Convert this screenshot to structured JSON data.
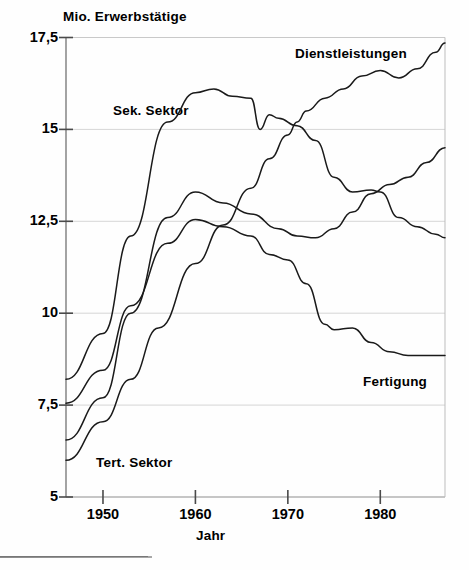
{
  "chart_data": {
    "type": "line",
    "title": "",
    "ylabel": "Mio. Erwerbstätige",
    "xlabel": "Jahr",
    "ylim": [
      5,
      17.5
    ],
    "xlim": [
      1946,
      1987
    ],
    "yticks": [
      "5",
      "7,5",
      "10",
      "12,5",
      "15",
      "17,5"
    ],
    "ytick_values": [
      5,
      7.5,
      10,
      12.5,
      15,
      17.5
    ],
    "xticks": [
      "1950",
      "1960",
      "1970",
      "1980"
    ],
    "xtick_values": [
      1950,
      1960,
      1970,
      1980
    ],
    "grid": true,
    "legend_position": "inline-annotations",
    "line_color": "#1a1a1a",
    "series": [
      {
        "name": "Dienstleistungen",
        "label_text": "Dienstleistungen",
        "x": [
          1946,
          1950,
          1953,
          1956,
          1960,
          1963,
          1966,
          1968,
          1970,
          1971,
          1972,
          1974,
          1976,
          1978,
          1980,
          1982,
          1984,
          1986,
          1987
        ],
        "values": [
          6.0,
          7.05,
          8.2,
          9.6,
          11.35,
          12.4,
          13.4,
          14.2,
          14.85,
          15.2,
          15.5,
          15.85,
          16.1,
          16.45,
          16.6,
          16.4,
          16.65,
          17.1,
          17.35
        ]
      },
      {
        "name": "Sek. Sektor",
        "label_text": "Sek. Sektor",
        "x": [
          1946,
          1950,
          1953,
          1957,
          1960,
          1962,
          1964,
          1966,
          1967,
          1968,
          1969,
          1971,
          1973,
          1975,
          1977,
          1979,
          1980,
          1982,
          1984,
          1986,
          1987
        ],
        "values": [
          8.2,
          9.45,
          12.1,
          15.2,
          16.0,
          16.1,
          15.9,
          15.85,
          15.0,
          15.4,
          15.3,
          15.1,
          14.7,
          13.7,
          13.3,
          13.35,
          13.3,
          12.6,
          12.35,
          12.15,
          12.05
        ]
      },
      {
        "name": "Tert. Sektor",
        "label_text": "Tert. Sektor",
        "x": [
          1946,
          1950,
          1953,
          1957,
          1960,
          1963,
          1966,
          1969,
          1971,
          1973,
          1975,
          1977,
          1979,
          1981,
          1983,
          1985,
          1987
        ],
        "values": [
          6.55,
          7.7,
          10.0,
          12.6,
          13.3,
          13.0,
          12.7,
          12.3,
          12.1,
          12.05,
          12.3,
          12.75,
          13.25,
          13.5,
          13.7,
          14.1,
          14.5
        ]
      },
      {
        "name": "Fertigung",
        "label_text": "Fertigung",
        "x": [
          1946,
          1950,
          1953,
          1957,
          1960,
          1963,
          1966,
          1968,
          1970,
          1972,
          1974,
          1975,
          1977,
          1979,
          1981,
          1983,
          1985,
          1987
        ],
        "values": [
          7.55,
          8.45,
          10.2,
          11.9,
          12.55,
          12.35,
          12.1,
          11.6,
          11.45,
          10.8,
          9.7,
          9.55,
          9.6,
          9.2,
          8.95,
          8.85,
          8.85,
          8.85
        ]
      }
    ]
  },
  "labels": {
    "ylabel_title": "Mio. Erwerbstätige",
    "xlabel_title": "Jahr",
    "series_sek": "Sek. Sektor",
    "series_dienst": "Dienstleistungen",
    "series_fert": "Fertigung",
    "series_tert": "Tert. Sektor",
    "ytick_0": "5",
    "ytick_1": "7,5",
    "ytick_2": "10",
    "ytick_3": "12,5",
    "ytick_4": "15",
    "ytick_5": "17,5",
    "xtick_0": "1950",
    "xtick_1": "1960",
    "xtick_2": "1970",
    "xtick_3": "1980"
  }
}
